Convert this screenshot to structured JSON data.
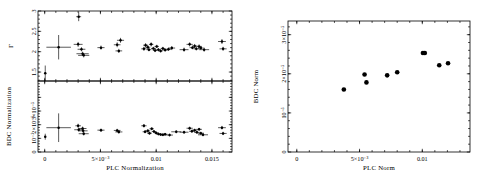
{
  "figure": {
    "background": "#ffffff",
    "ink": "#000000",
    "panel_count": 2
  },
  "chart_data": [
    {
      "id": "left-top",
      "type": "scatter",
      "title": "",
      "xlabel": "PLC Normalization",
      "ylabel": "Γ",
      "xlim": [
        -0.0006,
        0.0168
      ],
      "ylim": [
        1.28,
        3.0
      ],
      "xticks": [
        0,
        0.005,
        0.01,
        0.015
      ],
      "xticklabels": [
        "0",
        "5×10⁻³",
        "0.01",
        "0.015"
      ],
      "yticks": [
        1.5,
        2,
        2.5,
        3
      ],
      "yticklabels": [
        "1.5",
        "2",
        "2.5",
        "3"
      ],
      "grid": false,
      "legend": null,
      "errorbars": "xy",
      "points": [
        {
          "x": 5e-05,
          "y": 1.47,
          "xerr": 6e-05,
          "yerr": 0.19
        },
        {
          "x": 0.00125,
          "y": 2.11,
          "xerr": 0.0011,
          "yerr": 0.3
        },
        {
          "x": 0.00305,
          "y": 2.86,
          "xerr": 0.00022,
          "yerr": 0.11
        },
        {
          "x": 0.003,
          "y": 2.18,
          "xerr": 0.0004,
          "yerr": 0.06
        },
        {
          "x": 0.0033,
          "y": 2.06,
          "xerr": 0.00035,
          "yerr": 0.05
        },
        {
          "x": 0.0034,
          "y": 1.95,
          "xerr": 0.00055,
          "yerr": 0.05
        },
        {
          "x": 0.0035,
          "y": 1.91,
          "xerr": 0.0005,
          "yerr": 0.05
        },
        {
          "x": 0.00505,
          "y": 2.1,
          "xerr": 0.00032,
          "yerr": 0.05
        },
        {
          "x": 0.0065,
          "y": 2.17,
          "xerr": 0.0003,
          "yerr": 0.06
        },
        {
          "x": 0.0068,
          "y": 2.28,
          "xerr": 0.00032,
          "yerr": 0.06
        },
        {
          "x": 0.00665,
          "y": 2.02,
          "xerr": 0.0003,
          "yerr": 0.05
        },
        {
          "x": 0.0089,
          "y": 2.07,
          "xerr": 0.00024,
          "yerr": 0.05
        },
        {
          "x": 0.00905,
          "y": 2.16,
          "xerr": 0.00022,
          "yerr": 0.05
        },
        {
          "x": 0.00925,
          "y": 2.11,
          "xerr": 0.00022,
          "yerr": 0.05
        },
        {
          "x": 0.00935,
          "y": 2.05,
          "xerr": 0.00022,
          "yerr": 0.04
        },
        {
          "x": 0.00955,
          "y": 2.18,
          "xerr": 0.0002,
          "yerr": 0.05
        },
        {
          "x": 0.00975,
          "y": 2.08,
          "xerr": 0.00022,
          "yerr": 0.04
        },
        {
          "x": 0.0099,
          "y": 2.03,
          "xerr": 0.0002,
          "yerr": 0.04
        },
        {
          "x": 0.01005,
          "y": 2.13,
          "xerr": 0.0002,
          "yerr": 0.04
        },
        {
          "x": 0.0102,
          "y": 2.05,
          "xerr": 0.0002,
          "yerr": 0.04
        },
        {
          "x": 0.0104,
          "y": 2.02,
          "xerr": 0.0002,
          "yerr": 0.04
        },
        {
          "x": 0.0106,
          "y": 2.08,
          "xerr": 0.0002,
          "yerr": 0.04
        },
        {
          "x": 0.0108,
          "y": 2.04,
          "xerr": 0.00022,
          "yerr": 0.04
        },
        {
          "x": 0.0111,
          "y": 2.06,
          "xerr": 0.00025,
          "yerr": 0.04
        },
        {
          "x": 0.0114,
          "y": 2.09,
          "xerr": 0.0003,
          "yerr": 0.05
        },
        {
          "x": 0.0125,
          "y": 2.05,
          "xerr": 0.0004,
          "yerr": 0.05
        },
        {
          "x": 0.013,
          "y": 2.18,
          "xerr": 0.00028,
          "yerr": 0.05
        },
        {
          "x": 0.01325,
          "y": 2.1,
          "xerr": 0.00025,
          "yerr": 0.04
        },
        {
          "x": 0.01345,
          "y": 2.14,
          "xerr": 0.00025,
          "yerr": 0.05
        },
        {
          "x": 0.0136,
          "y": 2.07,
          "xerr": 0.00025,
          "yerr": 0.04
        },
        {
          "x": 0.01385,
          "y": 2.13,
          "xerr": 0.00025,
          "yerr": 0.05
        },
        {
          "x": 0.014,
          "y": 2.09,
          "xerr": 0.00025,
          "yerr": 0.04
        },
        {
          "x": 0.0143,
          "y": 2.05,
          "xerr": 0.00045,
          "yerr": 0.05
        },
        {
          "x": 0.0159,
          "y": 2.25,
          "xerr": 0.00035,
          "yerr": 0.06
        },
        {
          "x": 0.016,
          "y": 2.07,
          "xerr": 0.00032,
          "yerr": 0.05
        }
      ]
    },
    {
      "id": "left-bottom",
      "type": "scatter",
      "title": "",
      "xlabel": "PLC Normalization",
      "ylabel": "BDC Normalization",
      "xlim": [
        -0.0006,
        0.0168
      ],
      "ylim": [
        0,
        5.2e-05
      ],
      "xticks": [
        0,
        0.005,
        0.01,
        0.015
      ],
      "xticklabels": [
        "0",
        "5×10⁻³",
        "0.01",
        "0.015"
      ],
      "yticks": [
        0,
        1e-05,
        2e-05,
        3e-05,
        4e-05
      ],
      "yticklabels": [
        "0",
        "10⁻⁵",
        "2×10⁻⁵",
        "3×10⁻⁵",
        "4×10⁻⁵"
      ],
      "grid": false,
      "legend": null,
      "errorbars": "xy",
      "points": [
        {
          "x": 5e-05,
          "y": 1.12e-05,
          "xerr": 6e-05,
          "yerr": 2.2e-06
        },
        {
          "x": 0.00125,
          "y": 1.78e-05,
          "xerr": 0.0011,
          "yerr": 1.05e-05
        },
        {
          "x": 0.003,
          "y": 1.92e-05,
          "xerr": 0.00025,
          "yerr": 1.5e-06
        },
        {
          "x": 0.00305,
          "y": 1.63e-05,
          "xerr": 0.0004,
          "yerr": 1.4e-06
        },
        {
          "x": 0.0034,
          "y": 1.72e-05,
          "xerr": 0.00035,
          "yerr": 1.4e-06
        },
        {
          "x": 0.00345,
          "y": 1.55e-05,
          "xerr": 0.0004,
          "yerr": 1.3e-06
        },
        {
          "x": 0.0035,
          "y": 1.34e-05,
          "xerr": 0.00045,
          "yerr": 1.3e-06
        },
        {
          "x": 0.00505,
          "y": 1.6e-05,
          "xerr": 0.00032,
          "yerr": 1.2e-06
        },
        {
          "x": 0.0065,
          "y": 1.58e-05,
          "xerr": 0.0003,
          "yerr": 1.2e-06
        },
        {
          "x": 0.00665,
          "y": 1.47e-05,
          "xerr": 0.00032,
          "yerr": 1.2e-06
        },
        {
          "x": 0.0089,
          "y": 1.92e-05,
          "xerr": 0.00024,
          "yerr": 1.3e-06
        },
        {
          "x": 0.009,
          "y": 1.48e-05,
          "xerr": 0.00022,
          "yerr": 1.1e-06
        },
        {
          "x": 0.00925,
          "y": 1.55e-05,
          "xerr": 0.00022,
          "yerr": 1.1e-06
        },
        {
          "x": 0.0094,
          "y": 1.38e-05,
          "xerr": 0.00022,
          "yerr": 1.1e-06
        },
        {
          "x": 0.0096,
          "y": 1.7e-05,
          "xerr": 0.0002,
          "yerr": 1.1e-06
        },
        {
          "x": 0.0098,
          "y": 1.5e-05,
          "xerr": 0.0002,
          "yerr": 1e-06
        },
        {
          "x": 0.01,
          "y": 1.4e-05,
          "xerr": 0.0002,
          "yerr": 1e-06
        },
        {
          "x": 0.0102,
          "y": 1.32e-05,
          "xerr": 0.0002,
          "yerr": 1e-06
        },
        {
          "x": 0.0104,
          "y": 1.28e-05,
          "xerr": 0.0002,
          "yerr": 1e-06
        },
        {
          "x": 0.0106,
          "y": 1.26e-05,
          "xerr": 0.0002,
          "yerr": 1e-06
        },
        {
          "x": 0.0108,
          "y": 1.3e-05,
          "xerr": 0.00022,
          "yerr": 1e-06
        },
        {
          "x": 0.0112,
          "y": 1.24e-05,
          "xerr": 0.0003,
          "yerr": 1e-06
        },
        {
          "x": 0.0118,
          "y": 1.48e-05,
          "xerr": 0.00045,
          "yerr": 1.1e-06
        },
        {
          "x": 0.0125,
          "y": 1.45e-05,
          "xerr": 0.0004,
          "yerr": 1.1e-06
        },
        {
          "x": 0.013,
          "y": 1.74e-05,
          "xerr": 0.00028,
          "yerr": 1.2e-06
        },
        {
          "x": 0.0132,
          "y": 1.52e-05,
          "xerr": 0.00025,
          "yerr": 1.1e-06
        },
        {
          "x": 0.01345,
          "y": 1.6e-05,
          "xerr": 0.00025,
          "yerr": 1.1e-06
        },
        {
          "x": 0.01365,
          "y": 1.44e-05,
          "xerr": 0.00025,
          "yerr": 1.1e-06
        },
        {
          "x": 0.01385,
          "y": 1.66e-05,
          "xerr": 0.00025,
          "yerr": 1.1e-06
        },
        {
          "x": 0.014,
          "y": 1.38e-05,
          "xerr": 0.00028,
          "yerr": 1.1e-06
        },
        {
          "x": 0.0142,
          "y": 1.26e-05,
          "xerr": 0.00045,
          "yerr": 1.1e-06
        },
        {
          "x": 0.0159,
          "y": 1.78e-05,
          "xerr": 0.00035,
          "yerr": 1.3e-06
        },
        {
          "x": 0.016,
          "y": 1.36e-05,
          "xerr": 0.00032,
          "yerr": 1.2e-06
        }
      ]
    },
    {
      "id": "right",
      "type": "scatter",
      "title": "",
      "xlabel": "PLC Norm",
      "ylabel": "BDC Norm",
      "xlim": [
        -0.0007,
        0.0138
      ],
      "ylim": [
        0,
        3.35e-05
      ],
      "xticks": [
        0,
        0.005,
        0.01
      ],
      "xticklabels": [
        "0",
        "5×10⁻³",
        "0.01"
      ],
      "yticks": [
        0,
        1e-05,
        2e-05,
        3e-05
      ],
      "yticklabels": [
        "0",
        "10⁻⁵",
        "2×10⁻⁵",
        "3×10⁻⁵"
      ],
      "grid": false,
      "legend": null,
      "errorbars": "none",
      "points": [
        {
          "x": 0.00375,
          "y": 1.6e-05
        },
        {
          "x": 0.0054,
          "y": 1.98e-05
        },
        {
          "x": 0.00555,
          "y": 1.78e-05
        },
        {
          "x": 0.0072,
          "y": 1.96e-05
        },
        {
          "x": 0.008,
          "y": 2.04e-05
        },
        {
          "x": 0.01005,
          "y": 2.53e-05
        },
        {
          "x": 0.0102,
          "y": 2.53e-05
        },
        {
          "x": 0.01135,
          "y": 2.22e-05
        },
        {
          "x": 0.01205,
          "y": 2.27e-05
        }
      ]
    }
  ]
}
